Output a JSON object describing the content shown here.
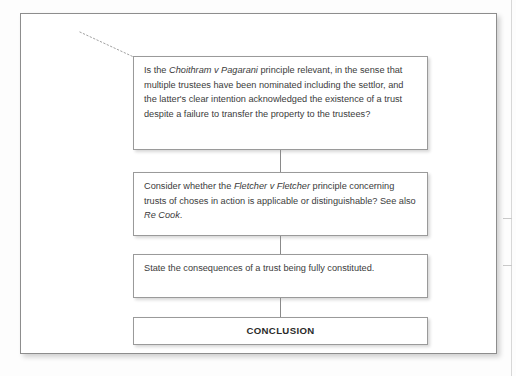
{
  "diagram": {
    "leader_line": {
      "name": "dotted-leader-line",
      "style": "dotted",
      "color": "#9b9b9b"
    },
    "connector_color": "#8a8a8a",
    "frame_border_color": "#8d8d8d",
    "node_border_color": "#9a9a9a",
    "text_color": "#3b3b3b",
    "nodes": [
      {
        "id": "node-choithram",
        "type": "question",
        "segments": [
          {
            "text": "Is the ",
            "italic": false
          },
          {
            "text": "Choithram v Pagarani",
            "italic": true
          },
          {
            "text": " principle relevant, in the sense that multiple trustees have been nominated including the settlor, and the latter's clear intention acknowledged the existence of a trust despite a failure to transfer the property to the trustees?",
            "italic": false
          }
        ],
        "plain_text": "Is the Choithram v Pagarani principle relevant, in the sense that multiple trustees have been nominated including the settlor, and the latter's clear intention acknowledged the existence of a trust despite a failure to transfer the property to the trustees?"
      },
      {
        "id": "node-fletcher",
        "type": "question",
        "segments": [
          {
            "text": "Consider whether the ",
            "italic": false
          },
          {
            "text": "Fletcher v Fletcher",
            "italic": true
          },
          {
            "text": " principle concerning trusts of choses in action is applicable or distinguishable? See also ",
            "italic": false
          },
          {
            "text": "Re Cook",
            "italic": true
          },
          {
            "text": ".",
            "italic": false
          }
        ],
        "plain_text": "Consider whether the Fletcher v Fletcher principle concerning trusts of choses in action is applicable or distinguishable? See also Re Cook."
      },
      {
        "id": "node-consequences",
        "type": "instruction",
        "segments": [
          {
            "text": "State the consequences of a trust being fully constituted.",
            "italic": false
          }
        ],
        "plain_text": "State the consequences of a trust being fully constituted."
      },
      {
        "id": "node-conclusion",
        "type": "terminal",
        "label": "CONCLUSION",
        "plain_text": "CONCLUSION"
      }
    ]
  }
}
